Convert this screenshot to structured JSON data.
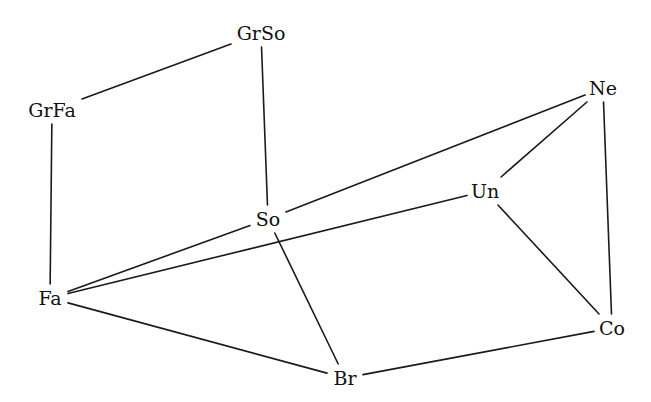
{
  "diagram": {
    "type": "lattice-graph",
    "nodes": [
      {
        "id": "GrSo",
        "label": "GrSo"
      },
      {
        "id": "GrFa",
        "label": "GrFa"
      },
      {
        "id": "Ne",
        "label": "Ne"
      },
      {
        "id": "Un",
        "label": "Un"
      },
      {
        "id": "So",
        "label": "So"
      },
      {
        "id": "Fa",
        "label": "Fa"
      },
      {
        "id": "Co",
        "label": "Co"
      },
      {
        "id": "Br",
        "label": "Br"
      }
    ],
    "edges": [
      {
        "from": "GrSo",
        "to": "GrFa"
      },
      {
        "from": "GrSo",
        "to": "So"
      },
      {
        "from": "GrFa",
        "to": "Fa"
      },
      {
        "from": "So",
        "to": "Ne"
      },
      {
        "from": "Ne",
        "to": "Un"
      },
      {
        "from": "Ne",
        "to": "Co"
      },
      {
        "from": "Un",
        "to": "Fa"
      },
      {
        "from": "Un",
        "to": "Co"
      },
      {
        "from": "So",
        "to": "Fa"
      },
      {
        "from": "So",
        "to": "Br"
      },
      {
        "from": "Fa",
        "to": "Br"
      },
      {
        "from": "Br",
        "to": "Co"
      }
    ]
  }
}
